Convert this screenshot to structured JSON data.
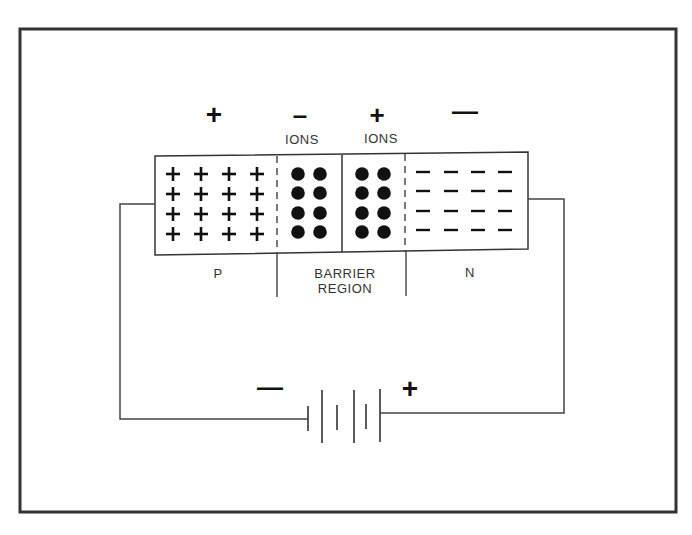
{
  "diagram": {
    "colors": {
      "line": "#333333",
      "ink": "#111111",
      "background": "#ffffff"
    },
    "charge_signs": {
      "p_side": "+",
      "negative_ions": "–",
      "positive_ions": "+",
      "n_side": "—"
    },
    "ion_labels": {
      "negative": "IONS",
      "positive": "IONS"
    },
    "regions": {
      "p": "P",
      "barrier_line1": "BARRIER",
      "barrier_line2": "REGION",
      "n": "N"
    },
    "battery": {
      "negative_terminal": "—",
      "positive_terminal": "+"
    },
    "p_region_carriers": {
      "symbol": "+",
      "rows": 4,
      "cols": 4
    },
    "negative_ion_dots": {
      "rows": 4,
      "cols": 2
    },
    "positive_ion_dots": {
      "rows": 4,
      "cols": 2
    },
    "n_region_carriers": {
      "symbol": "—",
      "rows": 4,
      "cols": 4
    }
  }
}
